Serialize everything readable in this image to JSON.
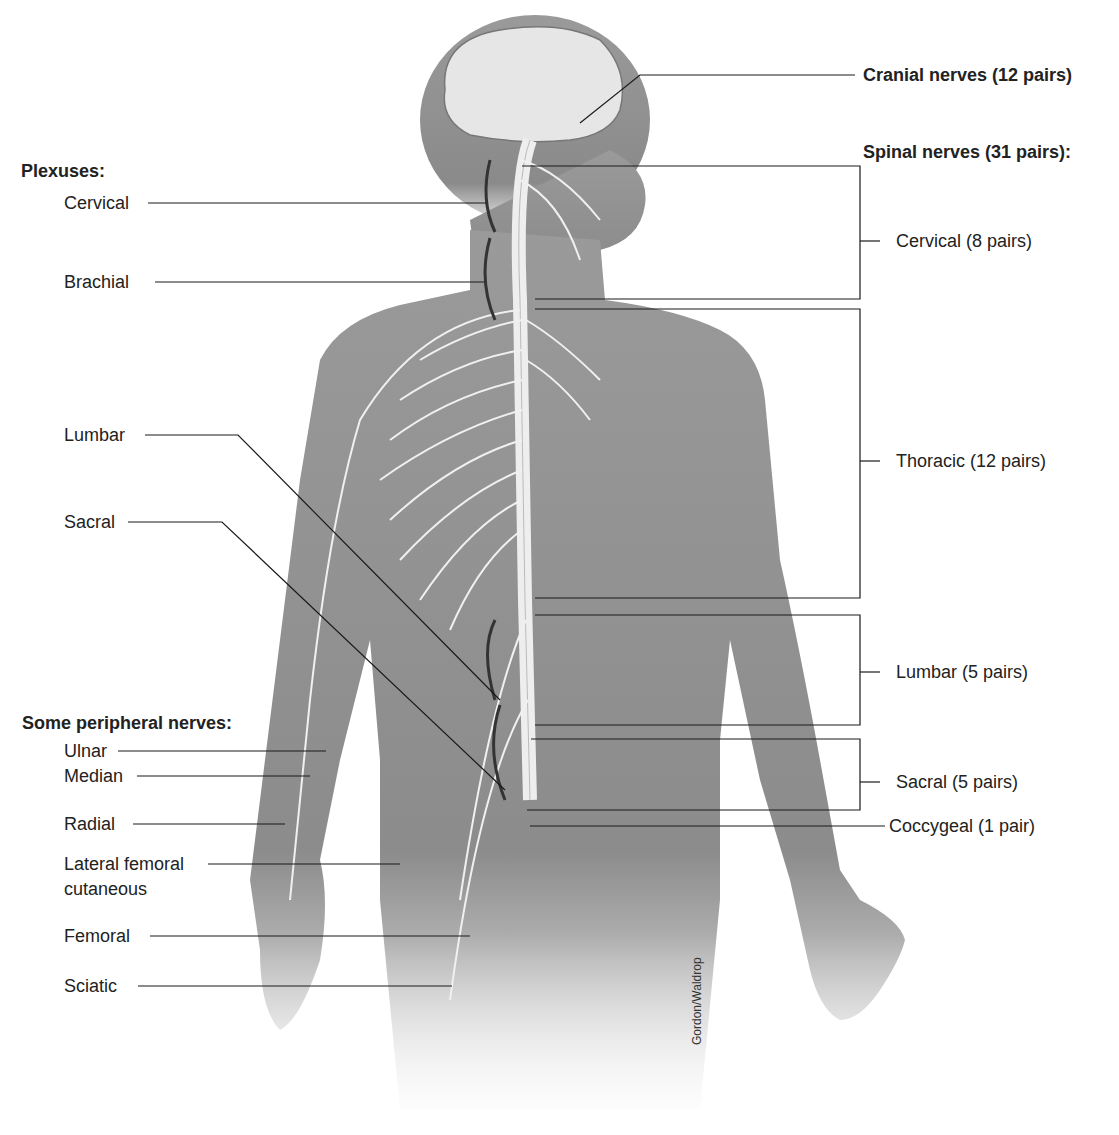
{
  "left": {
    "plexuses_heading": "Plexuses:",
    "plexuses": [
      {
        "label": "Cervical"
      },
      {
        "label": "Brachial"
      },
      {
        "label": "Lumbar"
      },
      {
        "label": "Sacral"
      }
    ],
    "peripheral_heading": "Some peripheral nerves:",
    "peripheral": [
      {
        "label": "Ulnar"
      },
      {
        "label": "Median"
      },
      {
        "label": "Radial"
      },
      {
        "label": "Lateral femoral"
      },
      {
        "label": "cutaneous"
      },
      {
        "label": "Femoral"
      },
      {
        "label": "Sciatic"
      }
    ]
  },
  "right": {
    "cranial": "Cranial nerves (12 pairs)",
    "spinal_heading": "Spinal nerves (31 pairs):",
    "spinal": [
      {
        "label": "Cervical (8 pairs)"
      },
      {
        "label": "Thoracic (12 pairs)"
      },
      {
        "label": "Lumbar (5 pairs)"
      },
      {
        "label": "Sacral (5 pairs)"
      },
      {
        "label": "Coccygeal (1 pair)"
      }
    ]
  },
  "credit": "Gordon/Waldrop",
  "colors": {
    "skin": "#8f8f8f",
    "brain": "#e6e6e6",
    "nerve": "#f2f2f2",
    "line": "#1a1a1a"
  }
}
